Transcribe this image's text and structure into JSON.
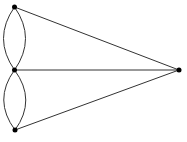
{
  "diagram": {
    "type": "multigraph",
    "nodes": [
      {
        "id": "A",
        "label": ""
      },
      {
        "id": "B",
        "label": ""
      },
      {
        "id": "C",
        "label": ""
      },
      {
        "id": "D",
        "label": ""
      }
    ],
    "edges": [
      {
        "from": "A",
        "to": "B",
        "kind": "curved",
        "side": "left"
      },
      {
        "from": "A",
        "to": "B",
        "kind": "curved",
        "side": "right"
      },
      {
        "from": "B",
        "to": "C",
        "kind": "curved",
        "side": "left"
      },
      {
        "from": "B",
        "to": "C",
        "kind": "curved",
        "side": "right"
      },
      {
        "from": "A",
        "to": "D",
        "kind": "straight"
      },
      {
        "from": "B",
        "to": "D",
        "kind": "straight"
      },
      {
        "from": "C",
        "to": "D",
        "kind": "straight"
      }
    ],
    "colors": {
      "edge": "#333333",
      "node": "#000000",
      "background": "#ffffff"
    }
  }
}
